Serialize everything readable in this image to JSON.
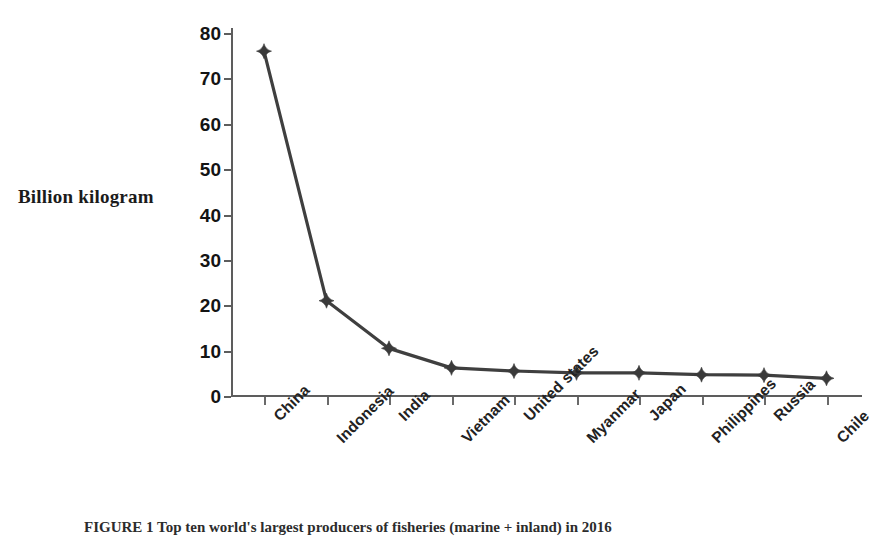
{
  "chart_data": {
    "type": "line",
    "title": "",
    "xlabel": "",
    "ylabel": "Billion kilogram",
    "ylim": [
      0,
      80
    ],
    "yticks": [
      0,
      10,
      20,
      30,
      40,
      50,
      60,
      70,
      80
    ],
    "ytick_labels": [
      "0",
      "10",
      "20",
      "30",
      "40",
      "50",
      "60",
      "70",
      "80"
    ],
    "grid": false,
    "legend": false,
    "legend_position": "none",
    "marker": "diamond",
    "line_color": "#3f3f3f",
    "marker_color": "#3a3a3a",
    "axis_color": "#5d5d5d",
    "categories": [
      "China",
      "Indonesia",
      "India",
      "Vietnam",
      "United states",
      "Myanmar",
      "Japan",
      "Philippines",
      "Russia",
      "Chile"
    ],
    "values": [
      76,
      21,
      10.5,
      6.2,
      5.5,
      5.1,
      5.1,
      4.7,
      4.6,
      3.9
    ],
    "series": [
      {
        "name": "Production",
        "values": [
          76,
          21,
          10.5,
          6.2,
          5.5,
          5.1,
          5.1,
          4.7,
          4.6,
          3.9
        ]
      }
    ]
  },
  "caption": {
    "text": "FIGURE 1 Top ten world's largest producers of fisheries (marine + inland) in 2016"
  }
}
